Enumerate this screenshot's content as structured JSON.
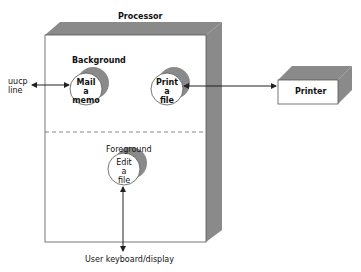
{
  "diagram": {
    "processor": {
      "label": "Processor"
    },
    "background": {
      "label": "Background"
    },
    "foreground": {
      "label": "Foreground"
    },
    "processes": [
      {
        "id": "mail",
        "lines": [
          "Mail",
          "a",
          "memo"
        ],
        "group": "background"
      },
      {
        "id": "print",
        "lines": [
          "Print",
          "a",
          "file"
        ],
        "group": "background"
      },
      {
        "id": "edit",
        "lines": [
          "Edit",
          "a",
          "file"
        ],
        "group": "foreground"
      }
    ],
    "external": {
      "uucp": {
        "lines": [
          "uucp",
          "line"
        ]
      },
      "printer": {
        "label": "Printer"
      },
      "user": {
        "label": "User keyboard/display"
      }
    },
    "colors": {
      "shade": "#8a8a8a",
      "line": "#222222",
      "face": "#ffffff"
    }
  }
}
